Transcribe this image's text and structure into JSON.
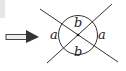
{
  "diagram": {
    "labels": {
      "top": "b",
      "bottom": "b",
      "left": "a",
      "right": "a"
    },
    "arrow_direction": "right",
    "colors": {
      "lines": "#333333",
      "arrow_head": "#333333",
      "arrow_shaft_fill": "#f0f0f0"
    }
  }
}
